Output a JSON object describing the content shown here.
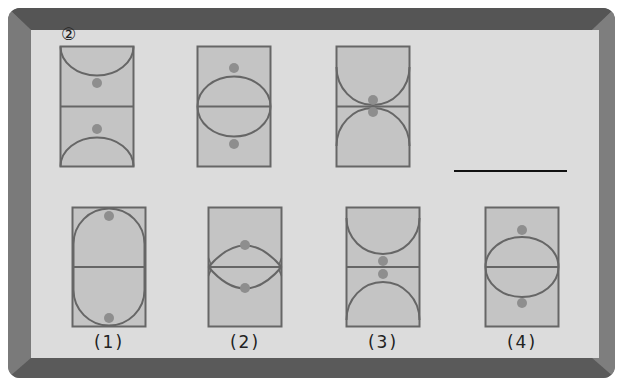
{
  "question": {
    "number_label": "②",
    "answer_blank": ""
  },
  "colors": {
    "frame": "#6f6f6f",
    "frame_light": "#8a8a8a",
    "frame_dark": "#4e4e4e",
    "panel": "#dcdcdc",
    "court_fill": "#c4c4c4",
    "line": "#666666",
    "dot": "#8e8e8e"
  },
  "sequence_figures": [
    {
      "id": "seq-1",
      "pattern": "half-circles-at-ends, dots near center"
    },
    {
      "id": "seq-2",
      "pattern": "center ellipse, dots outside"
    },
    {
      "id": "seq-3",
      "pattern": "half-circles touching center, dots at center"
    }
  ],
  "choices": [
    {
      "label": "(1)",
      "pattern": "tall oval full height, dots at top/bottom"
    },
    {
      "label": "(2)",
      "pattern": "lens shape, dots above/below"
    },
    {
      "label": "(3)",
      "pattern": "half-circles, dots at center"
    },
    {
      "label": "(4)",
      "pattern": "center ellipse, dots outside"
    }
  ]
}
